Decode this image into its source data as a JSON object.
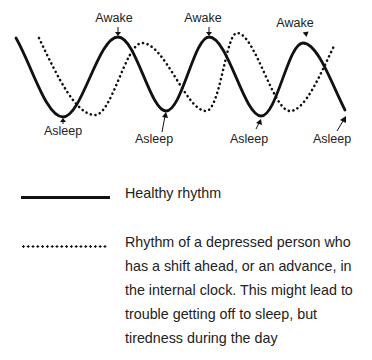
{
  "diagram": {
    "type": "circadian-rhythm-comparison",
    "labels": {
      "awake": [
        {
          "text": "Awake",
          "x": 114,
          "y": 14
        },
        {
          "text": "Awake",
          "x": 203,
          "y": 14
        },
        {
          "text": "Awake",
          "x": 295,
          "y": 19
        }
      ],
      "asleep": [
        {
          "text": "Asleep",
          "x": 63,
          "y": 126
        },
        {
          "text": "Asleep",
          "x": 154,
          "y": 133
        },
        {
          "text": "Asleep",
          "x": 249,
          "y": 133
        },
        {
          "text": "Asleep",
          "x": 332,
          "y": 133
        }
      ]
    },
    "series": [
      {
        "name": "healthy",
        "style": "solid",
        "points": [
          [
            16,
            38
          ],
          [
            63,
            117
          ],
          [
            118,
            37
          ],
          [
            166,
            111
          ],
          [
            209,
            37
          ],
          [
            261,
            116
          ],
          [
            303,
            43
          ],
          [
            345,
            110
          ]
        ]
      },
      {
        "name": "depressed",
        "style": "dotted",
        "points": [
          [
            39,
            38
          ],
          [
            95,
            115
          ],
          [
            142,
            43
          ],
          [
            206,
            111
          ],
          [
            237,
            33
          ],
          [
            290,
            111
          ],
          [
            335,
            44
          ]
        ]
      }
    ]
  },
  "legend": {
    "items": [
      {
        "style": "solid",
        "text": "Healthy rhythm"
      },
      {
        "style": "dotted",
        "lines": [
          "Rhythm of a depressed person who",
          "has a shift ahead, or an advance, in",
          "the internal clock. This might lead to",
          "trouble getting off to sleep, but",
          "tiredness during the day"
        ]
      }
    ]
  }
}
